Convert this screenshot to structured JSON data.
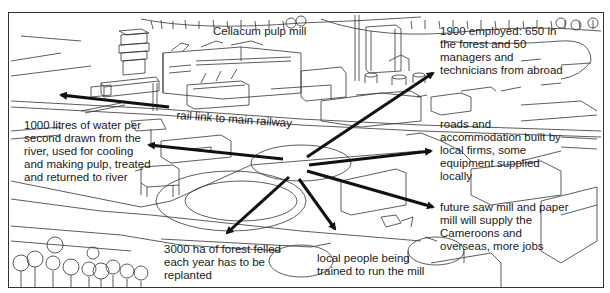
{
  "diagram": {
    "title": "Cellacum pulp mill",
    "hub": "central point of the mill site",
    "arrow_color": "#111111",
    "line_color": "#333333",
    "labels": {
      "rail": "rail link to main railway",
      "water": [
        "1000 litres of water per",
        "second drawn from the",
        "river, used for cooling",
        "and making pulp, treated",
        "and returned to river"
      ],
      "employed": [
        "1900 employed: 650 in",
        "the forest and 50",
        "managers and",
        "technicians from abroad"
      ],
      "roads": [
        "roads and",
        "accommodation built by",
        "local firms, some",
        "equipment supplied",
        "locally"
      ],
      "future": [
        "future saw mill and paper",
        "mill will supply the",
        "Cameroons and",
        "overseas, more jobs"
      ],
      "forest": [
        "3000 ha of forest felled",
        "each year has to be",
        "replanted"
      ],
      "local": [
        "local people being",
        "trained to run the mill"
      ]
    }
  }
}
